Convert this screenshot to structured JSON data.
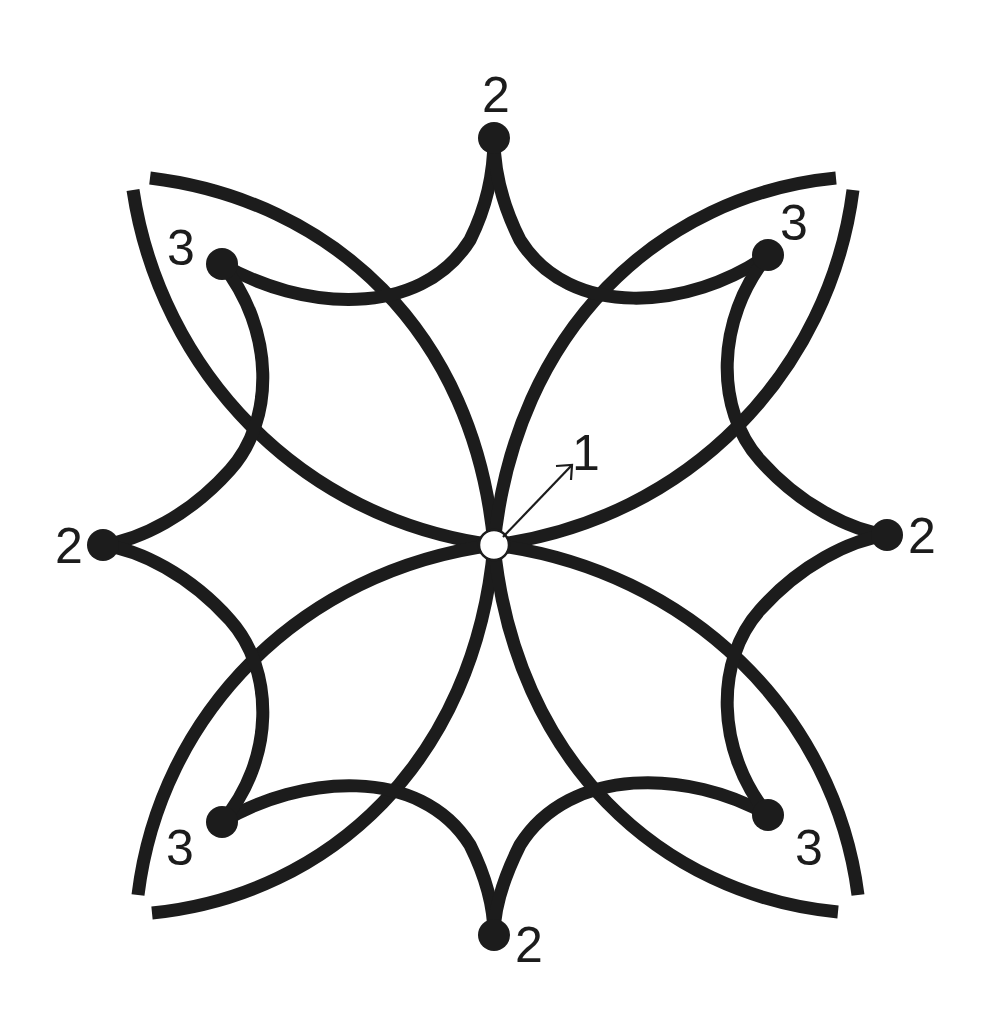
{
  "figure": {
    "colors": {
      "line": "#1c1c1c",
      "background": "#ffffff",
      "center_fill": "#ffffff"
    }
  },
  "labels": {
    "center": "1",
    "top": "2",
    "left": "2",
    "right": "2",
    "bottom": "2",
    "top_left": "3",
    "top_right": "3",
    "bottom_left": "3",
    "bottom_right": "3"
  },
  "points": {
    "center": {
      "label": "1",
      "type": "open-circle"
    },
    "cusps_2": [
      {
        "position": "top",
        "label": "2",
        "type": "filled-dot"
      },
      {
        "position": "left",
        "label": "2",
        "type": "filled-dot"
      },
      {
        "position": "right",
        "label": "2",
        "type": "filled-dot"
      },
      {
        "position": "bottom",
        "label": "2",
        "type": "filled-dot"
      }
    ],
    "cusps_3": [
      {
        "position": "top-left",
        "label": "3",
        "type": "filled-dot"
      },
      {
        "position": "top-right",
        "label": "3",
        "type": "filled-dot"
      },
      {
        "position": "bottom-left",
        "label": "3",
        "type": "filled-dot"
      },
      {
        "position": "bottom-right",
        "label": "3",
        "type": "filled-dot"
      }
    ]
  }
}
